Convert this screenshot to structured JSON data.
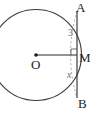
{
  "figure": {
    "kind": "circle-chord-geometry-diagram",
    "labels": {
      "center": "O",
      "chord_top": "A",
      "chord_bottom": "B",
      "chord_midpoint": "M",
      "segment_upper": "3",
      "segment_lower": "x"
    },
    "colors": {
      "stroke": "#2b2b2b",
      "circle_stroke": "#3a3a3a",
      "dashed_stroke": "#8d8d8d",
      "label_dark": "#232323",
      "label_light": "#6e6e6e",
      "background": "#ffffff"
    },
    "geometry": {
      "circle_center_x": 36,
      "circle_center_y": 55,
      "circle_radius": 46,
      "chord_x": 77,
      "chord_top_y": 11,
      "chord_bottom_y": 98,
      "right_angle_mark": "perpendicular at M"
    }
  }
}
